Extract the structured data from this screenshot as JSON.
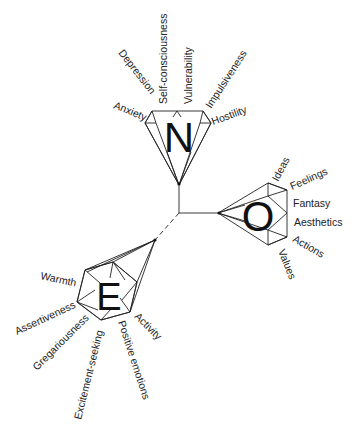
{
  "diagram": {
    "type": "hierarchical-trait-model",
    "root": {
      "x": 179,
      "y": 213
    },
    "domains": [
      {
        "letter": "N",
        "facets": [
          "Anxiety",
          "Depression",
          "Self-consciousness",
          "Vulnerability",
          "Impulsiveness",
          "Hostility"
        ]
      },
      {
        "letter": "O",
        "facets": [
          "Ideas",
          "Feelings",
          "Fantasy",
          "Aesthetics",
          "Actions",
          "Values"
        ]
      },
      {
        "letter": "E",
        "facets": [
          "Warmth",
          "Assertiveness",
          "Gregariousness",
          "Excitement-seeking",
          "Positive emotions",
          "Activity"
        ]
      }
    ],
    "colors": {
      "line": "#222222",
      "text": "#222222",
      "background": "#ffffff"
    }
  },
  "n": {
    "letter": "N",
    "facets": {
      "anxiety": "Anxiety",
      "depression": "Depression",
      "self_consciousness": "Self-consciousness",
      "vulnerability": "Vulnerability",
      "impulsiveness": "Impulsiveness",
      "hostility": "Hostility"
    }
  },
  "o": {
    "letter": "O",
    "facets": {
      "ideas": "Ideas",
      "feelings": "Feelings",
      "fantasy": "Fantasy",
      "aesthetics": "Aesthetics",
      "actions": "Actions",
      "values": "Values"
    }
  },
  "e": {
    "letter": "E",
    "facets": {
      "warmth": "Warmth",
      "assertiveness": "Assertiveness",
      "gregariousness": "Gregariousness",
      "excitement_seeking": "Excitement-seeking",
      "positive_emotions": "Positive emotions",
      "activity": "Activity"
    }
  }
}
